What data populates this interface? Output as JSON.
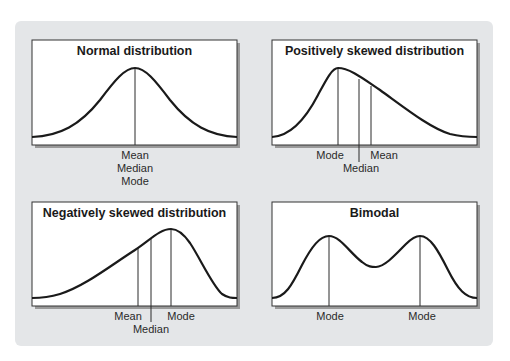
{
  "panels": [
    {
      "title": "Normal distribution",
      "labels": [
        "Mean",
        "Median",
        "Mode"
      ]
    },
    {
      "title": "Positively skewed distribution",
      "labels": {
        "mode": "Mode",
        "median": "Median",
        "mean": "Mean"
      }
    },
    {
      "title": "Negatively skewed distribution",
      "labels": {
        "mean": "Mean",
        "median": "Median",
        "mode": "Mode"
      }
    },
    {
      "title": "Bimodal",
      "labels": {
        "mode1": "Mode",
        "mode2": "Mode"
      }
    }
  ],
  "colors": {
    "backdrop": "#e4e6e8",
    "panel": "#ffffff",
    "curve": "#1a1a1a"
  }
}
